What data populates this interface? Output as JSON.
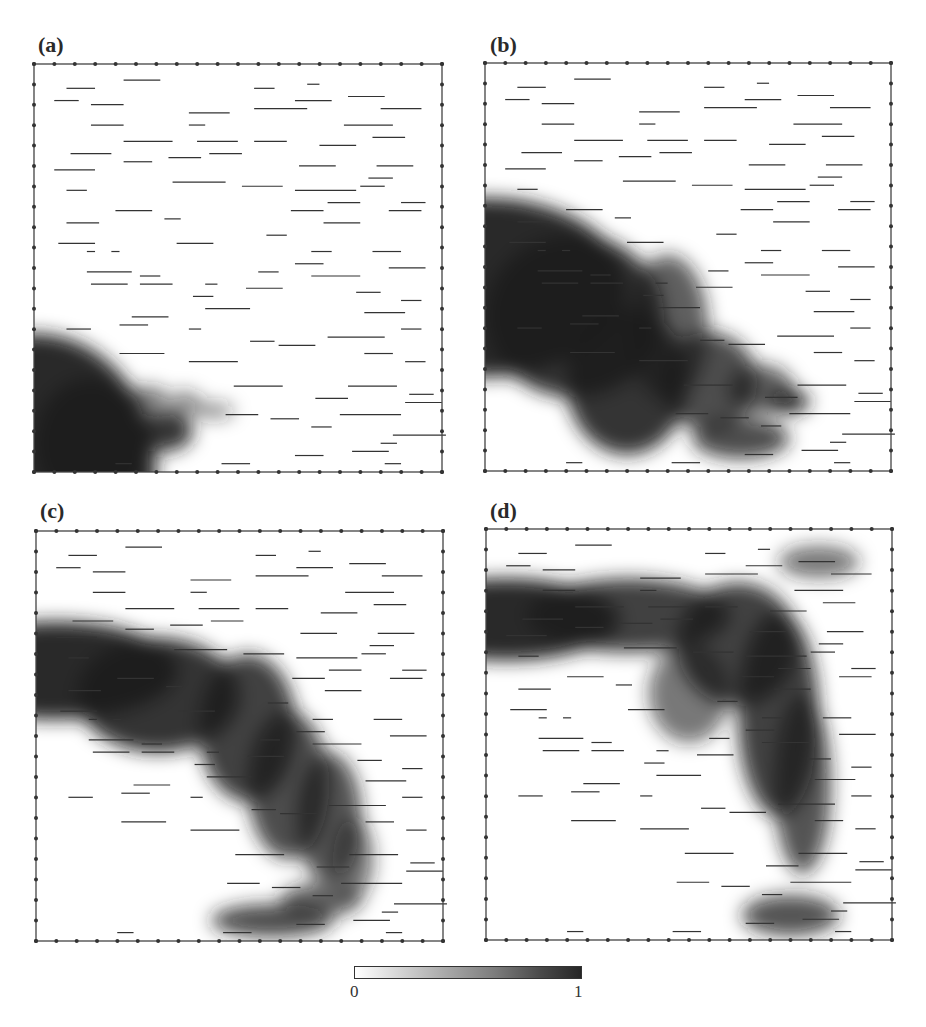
{
  "figure": {
    "panels": [
      {
        "id": "a",
        "label": "(a)"
      },
      {
        "id": "b",
        "label": "(b)"
      },
      {
        "id": "c",
        "label": "(c)"
      },
      {
        "id": "d",
        "label": "(d)"
      }
    ],
    "colorbar": {
      "min_label": "0",
      "max_label": "1",
      "colors": [
        "#ffffff",
        "#262626"
      ]
    }
  }
}
